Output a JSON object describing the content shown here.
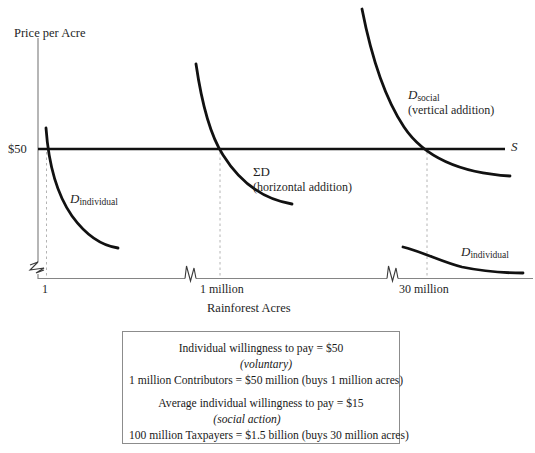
{
  "figure": {
    "axes": {
      "y_axis_title": "Price per Acre",
      "x_axis_title": "Rainforest Acres",
      "price_tick": "$50",
      "x_ticks": [
        {
          "label": "1"
        },
        {
          "label": "1 million"
        },
        {
          "label": "30 million"
        }
      ]
    },
    "curves": [
      {
        "name": "D_individual_left",
        "label_main": "D",
        "label_sub": "individual"
      },
      {
        "name": "sum_D",
        "label_main": "ΣD",
        "label_note": "(horizontal addition)"
      },
      {
        "name": "D_social",
        "label_main": "D",
        "label_sub": "social",
        "label_note": "(vertical addition)"
      },
      {
        "name": "D_individual_right",
        "label_main": "D",
        "label_sub": "individual"
      },
      {
        "name": "supply",
        "label_main": "S"
      }
    ]
  },
  "infobox": {
    "groups": [
      {
        "lines": [
          {
            "text": "Individual willingness to pay = $50",
            "style": "normal"
          },
          {
            "text": "(voluntary)",
            "style": "italic"
          },
          {
            "text": "1 million Contributors = $50 million (buys 1 million acres)",
            "style": "normal"
          }
        ]
      },
      {
        "lines": [
          {
            "text": "Average individual willingness to pay = $15",
            "style": "normal"
          },
          {
            "text": "(social action)",
            "style": "italic"
          },
          {
            "text": "100 million Taxpayers = $1.5 billion (buys 30 million acres)",
            "style": "normal"
          }
        ]
      }
    ]
  },
  "colors": {
    "curve": "#111111",
    "axis": "#808080",
    "dashed": "#b0b0b0",
    "box_border": "#8c8c8c",
    "text": "#1f1f1f"
  }
}
